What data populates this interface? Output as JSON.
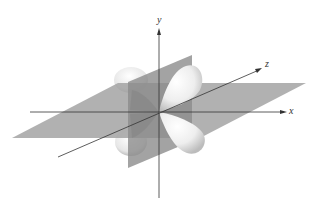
{
  "diagram": {
    "type": "d-orbital",
    "axes": {
      "x": {
        "label": "x"
      },
      "y": {
        "label": "y"
      },
      "z": {
        "label": "z"
      }
    },
    "nodal_planes": 2,
    "lobes": 4,
    "colors": {
      "background": "#ffffff",
      "plane": "#9a9a9a",
      "lobe": "#ececec",
      "axis": "#333333"
    }
  }
}
